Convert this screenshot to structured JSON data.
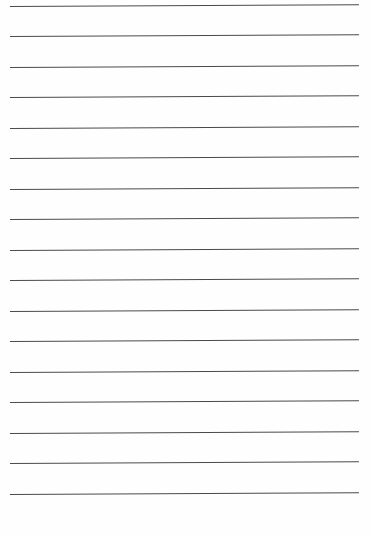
{
  "page": {
    "type": "lined-paper",
    "background_color": "#fefefe",
    "rule_color": "#4a4a4a",
    "rule_left": 10,
    "rule_width": 349,
    "rule_tilt_deg": -0.3,
    "rules_y": [
      6,
      36,
      67,
      97,
      128,
      158,
      189,
      219,
      250,
      280,
      311,
      341,
      372,
      402,
      433,
      463,
      494
    ]
  }
}
